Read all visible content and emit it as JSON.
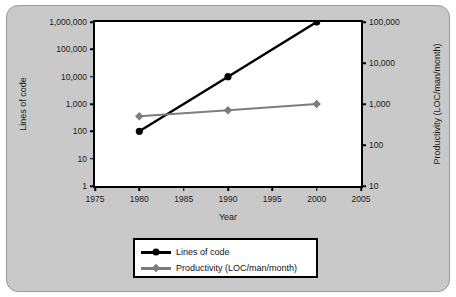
{
  "chart_data": {
    "type": "line",
    "title": "",
    "xlabel": "Year",
    "ylabel": "Lines of code",
    "y2label": "Productivity (LOC/man/month)",
    "x": [
      1980,
      1990,
      2000
    ],
    "xlim": [
      1975,
      2005
    ],
    "xticks": [
      "1975",
      "1980",
      "1985",
      "1990",
      "1995",
      "2000",
      "2005"
    ],
    "xtick_values": [
      1975,
      1980,
      1985,
      1990,
      1995,
      2000,
      2005
    ],
    "yscale": "log",
    "ylim": [
      1,
      1000000
    ],
    "yticks": [
      "1,000,000",
      "100,000",
      "10,000",
      "1,000",
      "100",
      "10",
      "1"
    ],
    "ytick_values": [
      1000000,
      100000,
      10000,
      1000,
      100,
      10,
      1
    ],
    "y2scale": "log",
    "y2lim": [
      10,
      100000
    ],
    "y2ticks": [
      "100,000",
      "10,000",
      "1,000",
      "100",
      "10"
    ],
    "y2tick_values": [
      100000,
      10000,
      1000,
      100,
      10
    ],
    "grid": false,
    "legend_position": "bottom",
    "series": [
      {
        "name": "Lines of code",
        "axis": "left",
        "color": "#000000",
        "marker": "circle",
        "values": [
          100,
          10000,
          1000000
        ]
      },
      {
        "name": "Productivity (LOC/man/month)",
        "axis": "right",
        "color": "#7d7d7d",
        "marker": "diamond",
        "values": [
          500,
          700,
          1000
        ]
      }
    ]
  },
  "legend": {
    "items": [
      {
        "label": "Lines of code"
      },
      {
        "label": "Productivity (LOC/man/month)"
      }
    ]
  },
  "colors": {
    "panel_background": "#c9c9c9",
    "plot_background": "#ffffff",
    "axis": "#000000",
    "series_1": "#000000",
    "series_2": "#7d7d7d"
  }
}
